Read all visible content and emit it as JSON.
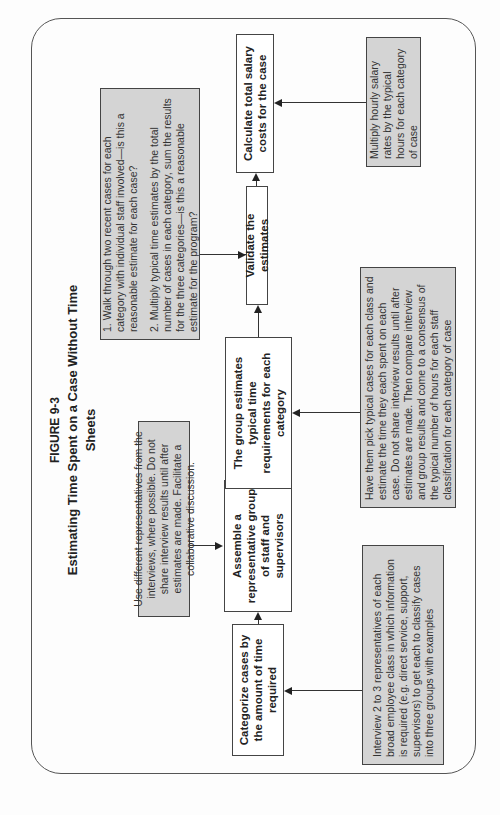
{
  "figure": {
    "label": "FIGURE 9-3",
    "title": "Estimating Time Spent on a Case Without Time Sheets"
  },
  "steps": [
    {
      "id": "categorize",
      "label": "Categorize cases by the amount of time required"
    },
    {
      "id": "assemble",
      "label": "Assemble a representative group of staff and supervisors"
    },
    {
      "id": "group_estimates",
      "label": "The group estimates typical time requirements for each category"
    },
    {
      "id": "validate",
      "label": "Validate the estimates"
    },
    {
      "id": "calculate",
      "label": "Calculate total salary costs for the case"
    }
  ],
  "notes": {
    "interview": "Interview 2 to 3 representatives of each broad employee class in which information is required (e.g. direct service, support, supervisors) to get each to classify cases into three groups with examples",
    "use_different": "Use different representatives from the interviews, where possible. Do not share interview results until after estimates are made. Facilitate a collaborative discussion.",
    "have_them": "Have them pick typical cases for each class and estimate the time they each spent on each case. Do not share interview results until after estimates are made. Then compare interview and group results and come to a consensus of the typical number of hours for each staff classification for each category of case",
    "validate_1": "1. Walk through two recent cases for each category with individual staff involved—is this a reasonable estimate for each case?",
    "validate_2": "2. Multiply typical time estimates by the total number of cases in each category, sum the results for the three categories—is this a reasonable estimate for the program?",
    "multiply": "Multiply hourly salary rates by the typical hours for each category of case"
  },
  "colors": {
    "note_fill": "#d4d4d4",
    "box_fill": "#ffffff",
    "stroke": "#444444"
  }
}
